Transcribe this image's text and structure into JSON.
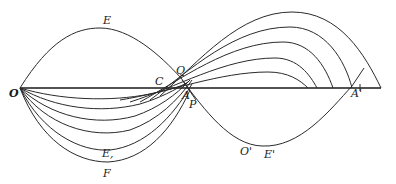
{
  "figure": {
    "stroke_color": "#2a2a2a",
    "background": "#ffffff",
    "labels": {
      "O": "O",
      "E": "E",
      "C": "C",
      "Q": "Q",
      "A": "A",
      "P": "P",
      "E_sub": "E,",
      "F": "F",
      "O_prime": "O'",
      "E_prime": "E'",
      "A_prime": "A'"
    }
  }
}
